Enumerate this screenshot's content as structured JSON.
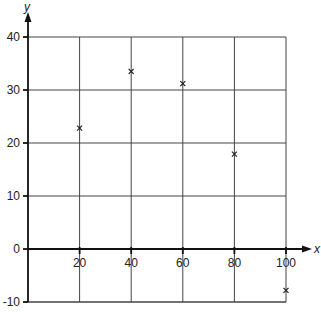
{
  "chart_data": {
    "type": "scatter",
    "title": "",
    "xlabel": "x",
    "ylabel": "y",
    "xlim": [
      0,
      100
    ],
    "ylim": [
      -10,
      40
    ],
    "grid": true,
    "legend": null,
    "x_ticks": [
      20,
      40,
      60,
      80,
      100
    ],
    "y_ticks": [
      -10,
      0,
      10,
      20,
      30,
      40
    ],
    "x_tick_labels": [
      "20",
      "40",
      "60",
      "80",
      "100"
    ],
    "y_tick_labels": [
      "-10",
      "0",
      "10",
      "20",
      "30",
      "40"
    ],
    "marker": "x",
    "series": [
      {
        "name": "data",
        "x": [
          20,
          40,
          60,
          80,
          100
        ],
        "y": [
          22.8,
          33.5,
          31.2,
          17.9,
          -7.8
        ]
      }
    ]
  },
  "layout": {
    "x0_px": 28,
    "x_scale": 2.58,
    "y0_px": 249,
    "y_scale": 5.3,
    "right_px": 286,
    "top_px": 38,
    "bottom_px": 303
  }
}
